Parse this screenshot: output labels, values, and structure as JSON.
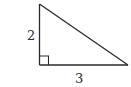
{
  "figure": {
    "type": "right-triangle",
    "stroke_color": "#2a2a2a",
    "background": "#ffffff",
    "vertices": {
      "top": [
        39.5,
        4
      ],
      "right_angle": [
        39.5,
        65
      ],
      "right": [
        128,
        65
      ]
    },
    "right_angle_marker_size": 9,
    "labels": {
      "vertical_leg": "2",
      "horizontal_leg": "3"
    }
  }
}
